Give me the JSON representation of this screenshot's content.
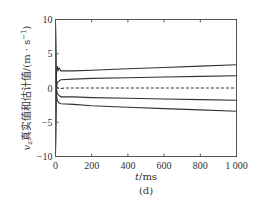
{
  "chart_data": {
    "type": "line",
    "title": "",
    "subtitle": "(d)",
    "xlabel": "t/ms",
    "ylabel": "v_z真实值和估计值/(m·s⁻¹)",
    "xlim": [
      0,
      1000
    ],
    "ylim": [
      -10,
      10
    ],
    "xticks": [
      0,
      200,
      400,
      600,
      800,
      1000
    ],
    "xtick_labels": [
      "0",
      "200",
      "400",
      "600",
      "800",
      "1 000"
    ],
    "yticks": [
      10,
      5,
      0,
      -5,
      -10
    ],
    "ytick_labels": [
      "10",
      "5",
      "0",
      "−5",
      "−10"
    ],
    "grid": false,
    "legend": null,
    "series": [
      {
        "name": "upper-bound-outer",
        "style": "solid",
        "x": [
          0,
          5,
          10,
          15,
          20,
          30,
          100,
          200,
          400,
          600,
          800,
          1000
        ],
        "values": [
          -9.5,
          2.0,
          3.2,
          2.6,
          2.9,
          2.5,
          2.5,
          2.6,
          2.8,
          3.0,
          3.2,
          3.4
        ]
      },
      {
        "name": "upper-bound-inner",
        "style": "solid",
        "x": [
          0,
          5,
          10,
          20,
          30,
          100,
          200,
          400,
          600,
          800,
          1000
        ],
        "values": [
          -9.5,
          0.0,
          0.8,
          1.0,
          1.2,
          1.3,
          1.4,
          1.5,
          1.6,
          1.7,
          1.8
        ]
      },
      {
        "name": "estimate",
        "style": "dashed",
        "x": [
          0,
          5,
          10,
          20,
          50,
          100,
          200,
          400,
          600,
          800,
          1000
        ],
        "values": [
          0.3,
          -0.2,
          0.1,
          -0.1,
          0.0,
          0.0,
          0.0,
          0.0,
          0.0,
          0.0,
          0.0
        ]
      },
      {
        "name": "lower-bound-inner",
        "style": "solid",
        "x": [
          0,
          5,
          10,
          20,
          30,
          100,
          200,
          400,
          600,
          800,
          1000
        ],
        "values": [
          9.5,
          0.0,
          -0.8,
          -1.1,
          -1.3,
          -1.3,
          -1.4,
          -1.5,
          -1.6,
          -1.7,
          -1.8
        ]
      },
      {
        "name": "lower-bound-outer",
        "style": "solid",
        "x": [
          0,
          5,
          10,
          20,
          30,
          100,
          200,
          400,
          600,
          800,
          1000
        ],
        "values": [
          9.5,
          -1.0,
          -1.8,
          -2.2,
          -2.3,
          -2.4,
          -2.6,
          -2.8,
          -3.0,
          -3.2,
          -3.4
        ]
      }
    ]
  },
  "labels": {
    "x_axis_title_italic": "t",
    "x_axis_title_unit": "/ms",
    "panel": "(d)",
    "y_axis_title_var": "v",
    "y_axis_title_sub": "z",
    "y_axis_title_text": "真实值和估计值/(m · s",
    "y_axis_title_sup": "−1",
    "y_axis_title_close": ")"
  },
  "colors": {
    "axis": "#555555",
    "line": "#333333",
    "text": "#333333"
  }
}
